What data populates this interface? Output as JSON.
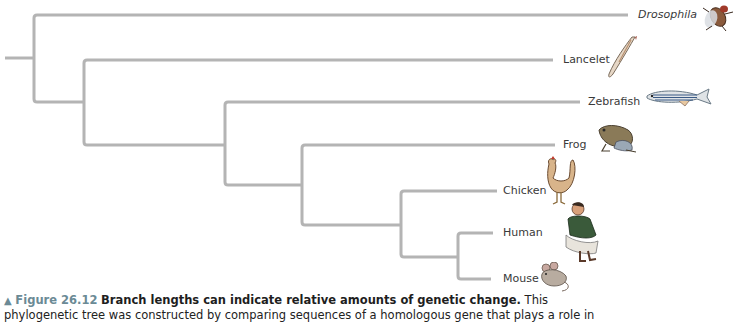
{
  "diagram": {
    "type": "phylogenetic-tree",
    "branch_color": "#b4b4b4",
    "taxa": [
      {
        "name": "Drosophila",
        "italic": true,
        "tip_y": 15,
        "tip_x": 628,
        "icon": "fruit-fly-icon"
      },
      {
        "name": "Lancelet",
        "italic": false,
        "tip_y": 60,
        "tip_x": 553,
        "icon": "lancelet-icon"
      },
      {
        "name": "Zebrafish",
        "italic": false,
        "tip_y": 102,
        "tip_x": 580,
        "icon": "zebrafish-icon"
      },
      {
        "name": "Frog",
        "italic": false,
        "tip_y": 145,
        "tip_x": 555,
        "icon": "frog-icon"
      },
      {
        "name": "Chicken",
        "italic": false,
        "tip_y": 191,
        "tip_x": 497,
        "icon": "chicken-icon"
      },
      {
        "name": "Human",
        "italic": false,
        "tip_y": 233,
        "tip_x": 493,
        "icon": "human-icon"
      },
      {
        "name": "Mouse",
        "italic": false,
        "tip_y": 279,
        "tip_x": 491,
        "icon": "mouse-icon"
      }
    ]
  },
  "caption": {
    "marker": "▲",
    "figure_number": "Figure 26.12",
    "title": "Branch lengths can indicate relative amounts of genetic change.",
    "body_line1": "This",
    "body_line2": "phylogenetic tree was constructed by comparing sequences of a homologous gene that plays a role in"
  }
}
